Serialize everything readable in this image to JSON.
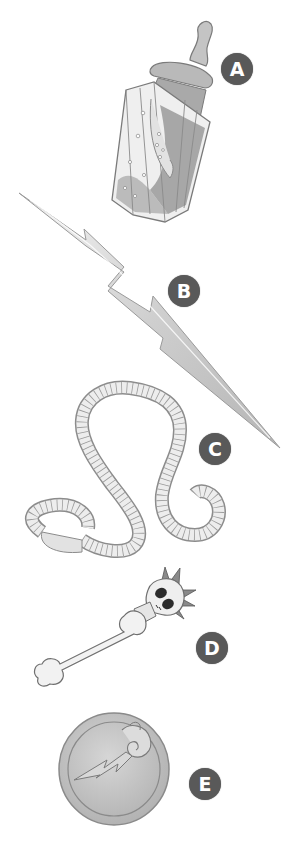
{
  "items": [
    {
      "id": "A",
      "label": "A",
      "name": "baby-bottle-flask",
      "badge": {
        "x": 221,
        "y": 53
      }
    },
    {
      "id": "B",
      "label": "B",
      "name": "lightning-bolt",
      "badge": {
        "x": 168,
        "y": 275
      }
    },
    {
      "id": "C",
      "label": "C",
      "name": "measuring-tape",
      "badge": {
        "x": 199,
        "y": 433
      }
    },
    {
      "id": "D",
      "label": "D",
      "name": "skull-bone-club",
      "badge": {
        "x": 196,
        "y": 632
      }
    },
    {
      "id": "E",
      "label": "E",
      "name": "coin-with-scroll-lightning-emblem",
      "badge": {
        "x": 189,
        "y": 768
      }
    }
  ],
  "colors": {
    "background": "#ffffff",
    "badge_fill": "#595959",
    "badge_text": "#ffffff",
    "outline": "#7a7a7a",
    "light_fill": "#e6e6e6",
    "mid_fill": "#bdbdbd",
    "dark_fill": "#8c8c8c"
  }
}
